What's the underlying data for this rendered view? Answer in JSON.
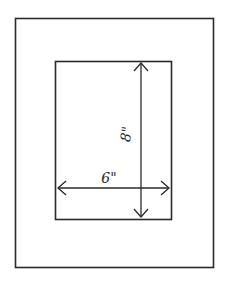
{
  "diagram": {
    "outer_frame": {
      "x": 15,
      "y": 18,
      "width": 198,
      "height": 249
    },
    "inner_opening": {
      "x": 55,
      "y": 61,
      "width": 116,
      "height": 158
    },
    "dimensions": {
      "width_label": "6\"",
      "height_label": "8\""
    },
    "colors": {
      "line": "#2a2a2a",
      "background": "#ffffff"
    }
  }
}
